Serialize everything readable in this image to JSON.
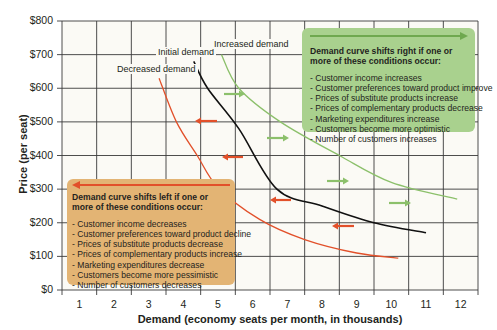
{
  "chart_data": {
    "type": "line",
    "title": "",
    "xlabel": "Demand (economy seats per month, in thousands)",
    "ylabel": "Price (per seat)",
    "xlim": [
      0.5,
      12.5
    ],
    "ylim": [
      0,
      800
    ],
    "x_ticks": [
      "1",
      "2",
      "3",
      "4",
      "5",
      "6",
      "7",
      "8",
      "9",
      "10",
      "11",
      "12"
    ],
    "y_ticks": [
      "$0",
      "$100",
      "$200",
      "$300",
      "$400",
      "$500",
      "$600",
      "$700",
      "$800"
    ],
    "grid": true,
    "series": [
      {
        "name": "Decreased demand",
        "color": "#e2502a",
        "points": [
          [
            3.3,
            630
          ],
          [
            3.8,
            500
          ],
          [
            4.4,
            400
          ],
          [
            5.0,
            305
          ],
          [
            6.2,
            210
          ],
          [
            7.5,
            150
          ],
          [
            9.0,
            110
          ],
          [
            10.2,
            95
          ]
        ]
      },
      {
        "name": "Initial demand",
        "color": "#111111",
        "points": [
          [
            4.3,
            680
          ],
          [
            4.7,
            600
          ],
          [
            5.6,
            480
          ],
          [
            6.7,
            300
          ],
          [
            8.0,
            250
          ],
          [
            9.5,
            200
          ],
          [
            11.0,
            170
          ]
        ]
      },
      {
        "name": "Increased demand",
        "color": "#8cc06b",
        "points": [
          [
            5.1,
            700
          ],
          [
            5.6,
            600
          ],
          [
            6.8,
            500
          ],
          [
            8.5,
            400
          ],
          [
            10.0,
            320
          ],
          [
            11.9,
            270
          ]
        ]
      }
    ],
    "annotations": {
      "right_shift_box": {
        "heading": "Demand curve shifts right if one or more of these conditions occur:",
        "items": [
          "- Customer income increases",
          "- Customer preferences toward product improve",
          "- Prices of substitute products increase",
          "- Prices of complementary products decrease",
          "- Marketing expenditures increase",
          "- Customers become more optimistic",
          "- Number of customers increases"
        ]
      },
      "left_shift_box": {
        "heading": "Demand curve shifts left if one or more of these conditions occur:",
        "items": [
          "- Customer income decreases",
          "- Customer preferences toward product decline",
          "- Prices of substitute products decrease",
          "- Prices of complementary products increase",
          "- Marketing expenditures decrease",
          "- Customers become more pessimistic",
          "- Number of customers decreases"
        ]
      }
    }
  },
  "labels": {
    "decreased": "Decreased demand",
    "initial": "Initial demand",
    "increased": "Increased demand"
  },
  "colors": {
    "grid": "#3a3a3a",
    "plot_bg": "#fbfaf5",
    "red": "#e2502a",
    "green": "#8cc06b",
    "black": "#111111",
    "green_box": "#a9d18e",
    "orange_box": "#e3b474"
  }
}
